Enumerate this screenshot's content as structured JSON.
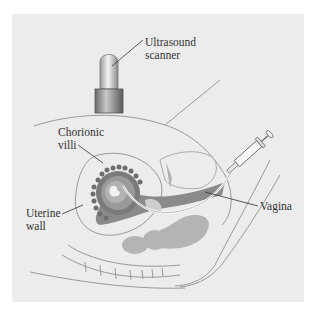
{
  "figure": {
    "labels": {
      "ultrasound_line1": "Ultrasound",
      "ultrasound_line2": "scanner",
      "chorionic_line1": "Chorionic",
      "chorionic_line2": "villi",
      "uterine_line1": "Uterine",
      "uterine_line2": "wall",
      "vagina": "Vagina"
    },
    "colors": {
      "background": "#ececec",
      "outline": "#8a8a8a",
      "dark_tissue": "#7d7d7d",
      "mid_tissue": "#9a9a9a",
      "light_tissue": "#b3b3b3",
      "villi": "#6e6e6e"
    }
  }
}
